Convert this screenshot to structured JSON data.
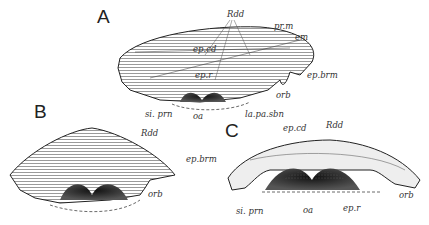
{
  "figure": {
    "panels": [
      {
        "id": "A",
        "letter": "A",
        "labels": {
          "rdd": "Rdd",
          "prm": "pr.m",
          "em": "em",
          "epcd": "ep.cd",
          "epr": "ep.r",
          "epbrm": "ep.brm",
          "orb": "orb",
          "siprn": "si. prn",
          "oa": "oa",
          "lapasbn": "la.pa.sbn"
        }
      },
      {
        "id": "B",
        "letter": "B",
        "labels": {
          "rdd": "Rdd",
          "orb": "orb"
        }
      },
      {
        "id": "C",
        "letter": "C",
        "labels": {
          "epcd": "ep.cd",
          "rdd": "Rdd",
          "epbrm": "ep.brm",
          "orb": "orb",
          "siprn": "si. prn",
          "oa": "oa",
          "epr": "ep.r"
        }
      }
    ],
    "colors": {
      "ink": "#222222",
      "background": "#ffffff"
    }
  }
}
